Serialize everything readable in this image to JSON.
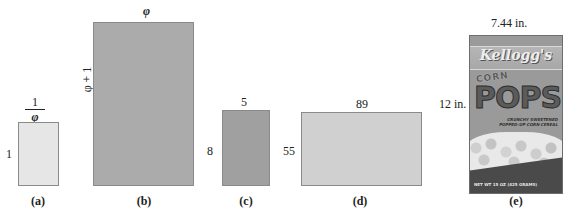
{
  "figure": {
    "panels": [
      {
        "id": "a",
        "caption": "(a)",
        "width_label": {
          "numerator": "1",
          "denominator": "φ"
        },
        "height_label": "1",
        "fill": "#e6e6e6"
      },
      {
        "id": "b",
        "caption": "(b)",
        "width_label": "φ",
        "height_label": "φ + 1",
        "fill": "#ababab"
      },
      {
        "id": "c",
        "caption": "(c)",
        "width_label": "5",
        "height_label": "8",
        "fill": "#a0a0a0"
      },
      {
        "id": "d",
        "caption": "(d)",
        "width_label": "89",
        "height_label": "55",
        "fill": "#d0d0d0"
      },
      {
        "id": "e",
        "caption": "(e)",
        "width_label": "7.44 in.",
        "height_label": "12 in.",
        "product": {
          "brand": "Kellogg's",
          "line1": "CORN",
          "line2": "POPS",
          "tagline_1": "CRUNCHY SWEETENED",
          "tagline_2": "POPPED-UP CORN CEREAL",
          "net_weight": "NET WT 15 OZ (425 GRAMS)"
        }
      }
    ]
  }
}
